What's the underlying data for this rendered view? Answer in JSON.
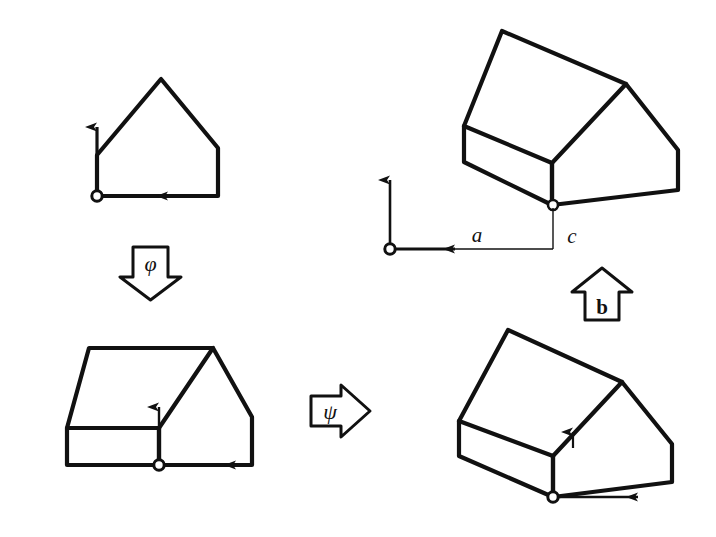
{
  "figure": {
    "kind": "commutative-diagram",
    "title": "",
    "background_color": "#ffffff",
    "ink_color": "#111111",
    "width": 716,
    "height": 537
  },
  "panels": [
    {
      "id": "top-left",
      "name": "flat-house-outline",
      "description": "2D house-shaped polygon with coordinate frame at lower-left corner",
      "origin_marker": "open-circle",
      "axes": [
        "vertical-up-arrow",
        "horizontal-right-arrow"
      ]
    },
    {
      "id": "bottom-left",
      "name": "prism-flat-view",
      "description": "3D extruded house viewed nearly edge-on, coordinate frame at interior base point",
      "origin_marker": "open-circle",
      "axes": [
        "vertical-up-arrow",
        "horizontal-right-arrow"
      ]
    },
    {
      "id": "top-right",
      "name": "prism-tilted-offset",
      "description": "3D extruded house tilted, coordinate frame detached and offset to the left by distance a and up by distance c",
      "origin_marker": "open-circle",
      "axes": [
        "vertical-up-arrow",
        "horizontal-right-arrow"
      ],
      "offset_labels": [
        "a",
        "c"
      ]
    },
    {
      "id": "bottom-right",
      "name": "prism-tilted-attached",
      "description": "3D extruded house tilted, coordinate frame attached at the shape base vertex",
      "origin_marker": "open-circle",
      "axes": [
        "vertical-up-arrow",
        "horizontal-right-arrow"
      ]
    }
  ],
  "maps": [
    {
      "id": "phi",
      "label": "φ",
      "direction": "down",
      "from": "top-left",
      "to": "bottom-left",
      "style": "block-arrow-outline"
    },
    {
      "id": "psi",
      "label": "ψ",
      "direction": "right",
      "from": "bottom-left",
      "to": "bottom-right",
      "style": "block-arrow-outline"
    },
    {
      "id": "b",
      "label": "b",
      "direction": "up",
      "from": "bottom-right",
      "to": "top-right",
      "style": "block-arrow-outline",
      "bold": true
    }
  ],
  "dimension_labels": [
    {
      "id": "a",
      "label": "a",
      "meaning": "horizontal offset of frame from shape origin"
    },
    {
      "id": "c",
      "label": "c",
      "meaning": "vertical offset of frame from shape origin"
    }
  ]
}
